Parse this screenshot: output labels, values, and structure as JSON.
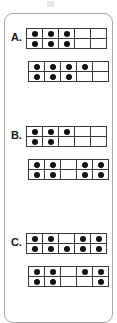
{
  "page": {
    "background_color": "#ffffff",
    "card_border_color": "#a8a8a8",
    "grid_line_color": "#3a3a3a",
    "dot_color": "#111111",
    "label_color": "#161616"
  },
  "sections": [
    {
      "label": "A.",
      "frames": [
        {
          "name": "frame-a-1",
          "columns": 5,
          "rows": [
            [
              true,
              true,
              true,
              false,
              false
            ],
            [
              true,
              true,
              true,
              false,
              false
            ]
          ],
          "dot_count": 6
        },
        {
          "name": "frame-a-2",
          "columns": 5,
          "rows": [
            [
              true,
              true,
              true,
              true,
              false
            ],
            [
              true,
              true,
              true,
              false,
              false
            ]
          ],
          "dot_count": 7
        }
      ]
    },
    {
      "label": "B.",
      "frames": [
        {
          "name": "frame-b-1",
          "columns": 5,
          "rows": [
            [
              true,
              true,
              true,
              false,
              false
            ],
            [
              true,
              true,
              false,
              false,
              false
            ]
          ],
          "dot_count": 5
        },
        {
          "name": "frame-b-2",
          "columns": 5,
          "rows": [
            [
              true,
              true,
              false,
              true,
              true
            ],
            [
              true,
              true,
              false,
              true,
              true
            ]
          ],
          "dot_count": 8
        }
      ]
    },
    {
      "label": "C.",
      "frames": [
        {
          "name": "frame-c-1",
          "columns": 5,
          "rows": [
            [
              true,
              true,
              false,
              true,
              true
            ],
            [
              true,
              true,
              true,
              true,
              true
            ]
          ],
          "dot_count": 9
        },
        {
          "name": "frame-c-2",
          "columns": 5,
          "rows": [
            [
              true,
              true,
              false,
              true,
              true
            ],
            [
              true,
              true,
              false,
              false,
              true
            ]
          ],
          "dot_count": 7
        }
      ]
    }
  ]
}
